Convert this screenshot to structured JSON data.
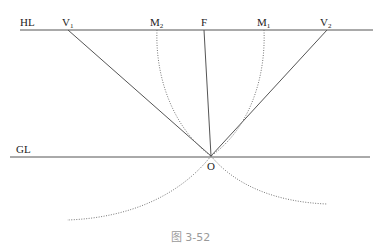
{
  "diagram": {
    "type": "perspective-construction",
    "labels": {
      "horizon_line": "HL",
      "ground_line": "GL",
      "v1": "V",
      "v1_sub": "1",
      "v2": "V",
      "v2_sub": "2",
      "m1": "M",
      "m1_sub": "1",
      "m2": "M",
      "m2_sub": "2",
      "focal": "F",
      "origin": "O"
    },
    "colors": {
      "line": "#555555",
      "dotted": "#777777",
      "caption": "#9a9a9a"
    }
  },
  "caption": "图 3-52"
}
